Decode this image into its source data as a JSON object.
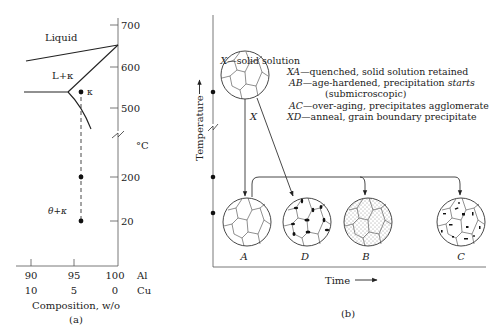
{
  "panel_a": {
    "caption": "(a)",
    "region_labels": {
      "liquid": "Liquid",
      "l_kappa": "L+κ",
      "kappa": "κ",
      "theta_kappa": "θ+κ"
    },
    "temp_axis": {
      "unit": "°C",
      "ticks": [
        "700",
        "600",
        "500",
        "200",
        "20"
      ]
    },
    "comp_axis": {
      "title": "Composition, w/o",
      "al_row": [
        "90",
        "95",
        "100"
      ],
      "al_label": "Al",
      "cu_row": [
        "10",
        "5",
        "0"
      ],
      "cu_label": "Cu"
    }
  },
  "panel_b": {
    "caption": "(b)",
    "y_axis_label": "Temperature",
    "x_axis_label": "Time",
    "transition_label": "X",
    "structures": [
      {
        "id": "X",
        "label": "X",
        "type": "solid-solution"
      },
      {
        "id": "A",
        "label": "A",
        "type": "quenched"
      },
      {
        "id": "D",
        "label": "D",
        "type": "grain-boundary-precipitate"
      },
      {
        "id": "B",
        "label": "B",
        "type": "fine-precipitate"
      },
      {
        "id": "C",
        "label": "C",
        "type": "agglomerated-precipitate"
      }
    ],
    "legend": [
      {
        "key": "X",
        "text": "—solid solution"
      },
      {
        "key": "XA",
        "text": "—quenched, solid solution retained"
      },
      {
        "key": "AB",
        "text": "—age-hardened, precipitation ",
        "emph": "starts"
      },
      {
        "key": "",
        "text": "(submicroscopic)"
      },
      {
        "key": "AC",
        "text": "—over-aging, precipitates agglomerate"
      },
      {
        "key": "XD",
        "text": "—anneal, grain boundary precipitate"
      }
    ]
  }
}
